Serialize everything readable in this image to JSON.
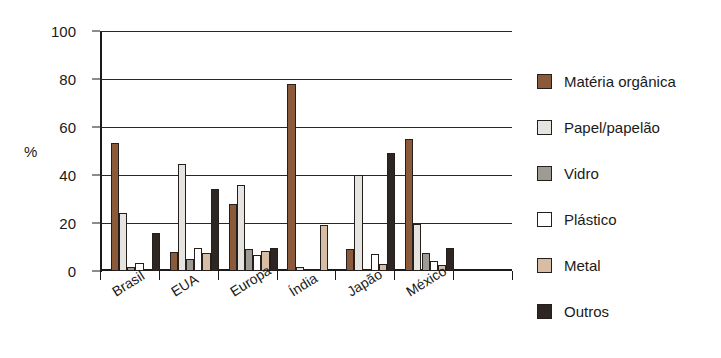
{
  "chart_data": {
    "type": "bar",
    "title": "",
    "subtitle": "",
    "xlabel": "",
    "ylabel": "%",
    "ylim": [
      0,
      100
    ],
    "yticks": [
      0,
      20,
      40,
      60,
      80,
      100
    ],
    "grid": true,
    "legend_position": "right",
    "orientation": "vertical-grouped",
    "categories": [
      "Brasil",
      "EUA",
      "Europa",
      "Índia",
      "Japão",
      "México"
    ],
    "series": [
      {
        "name": "Matéria orgânica",
        "color": "#8a5a3b",
        "values": [
          53.5,
          8.0,
          28.0,
          78.0,
          9.0,
          55.0
        ]
      },
      {
        "name": "Papel/papelão",
        "color": "#e6e4e0",
        "values": [
          24.0,
          44.5,
          36.0,
          1.5,
          40.0,
          19.5
        ]
      },
      {
        "name": "Vidro",
        "color": "#9e9b95",
        "values": [
          1.5,
          5.0,
          9.0,
          0.8,
          0.8,
          7.5
        ]
      },
      {
        "name": "Plástico",
        "color": "#ffffff",
        "values": [
          3.5,
          9.5,
          6.5,
          0.8,
          7.0,
          4.0
        ]
      },
      {
        "name": "Metal",
        "color": "#d6bda3",
        "values": [
          1.0,
          7.5,
          8.5,
          19.0,
          3.0,
          2.5
        ]
      },
      {
        "name": "Outros",
        "color": "#2e2622",
        "values": [
          16.0,
          34.0,
          9.5,
          0.0,
          49.0,
          9.5
        ]
      }
    ]
  },
  "legend": {
    "items": [
      {
        "label": "Matéria orgânica",
        "color": "#8a5a3b"
      },
      {
        "label": "Papel/papelão",
        "color": "#e6e4e0"
      },
      {
        "label": "Vidro",
        "color": "#9e9b95"
      },
      {
        "label": "Plástico",
        "color": "#ffffff"
      },
      {
        "label": "Metal",
        "color": "#d6bda3"
      },
      {
        "label": "Outros",
        "color": "#2e2622"
      }
    ]
  }
}
